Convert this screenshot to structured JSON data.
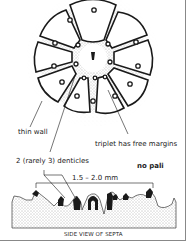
{
  "labels": {
    "thin_wall": "thin wall",
    "triplet": "triplet has free margins",
    "denticles": "2 (rarely 3) denticles",
    "no_pali": "no pali",
    "measurement": "1.5 – 2.0 mm",
    "caption": "SIDE VIEW OF SEPTA"
  },
  "colors": {
    "ink": "#1a1a1a",
    "stipple": "#555555",
    "border": "#888888"
  }
}
